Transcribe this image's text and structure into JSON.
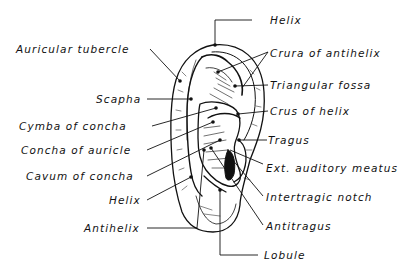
{
  "figure": {
    "colors": {
      "ink": "#111111",
      "background": "#ffffff"
    }
  },
  "labels_left": [
    {
      "id": "auricular-tubercle",
      "text": "Auricular  tubercle"
    },
    {
      "id": "scapha",
      "text": "Scapha"
    },
    {
      "id": "cymba-of-concha",
      "text": "Cymba of concha"
    },
    {
      "id": "concha-of-auricle",
      "text": "Concha of auricle"
    },
    {
      "id": "cavum-of-concha",
      "text": "Cavum of concha"
    },
    {
      "id": "helix-lower",
      "text": "Helix"
    },
    {
      "id": "antihelix",
      "text": "Antihelix"
    }
  ],
  "labels_right": [
    {
      "id": "helix-top",
      "text": "Helix"
    },
    {
      "id": "crura-of-antihelix",
      "text": "Crura of antihelix"
    },
    {
      "id": "triangular-fossa",
      "text": "Triangular fossa"
    },
    {
      "id": "crus-of-helix",
      "text": "Crus of helix"
    },
    {
      "id": "tragus",
      "text": "Tragus"
    },
    {
      "id": "ext-auditory-meatus",
      "text": "Ext. auditory meatus"
    },
    {
      "id": "intertragic-notch",
      "text": "Intertragic notch"
    },
    {
      "id": "antitragus",
      "text": "Antitragus"
    },
    {
      "id": "lobule",
      "text": "Lobule"
    }
  ]
}
